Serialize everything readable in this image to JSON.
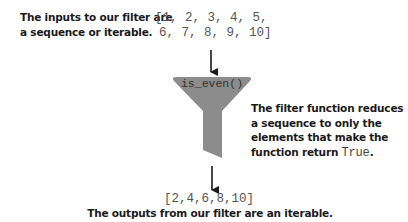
{
  "input": {
    "label_lines": [
      "The inputs to our filter are",
      "a sequence or iterable."
    ],
    "list_lines": [
      "[1, 2, 3, 4, 5,",
      "6, 7, 8, 9, 10]"
    ]
  },
  "filter": {
    "function_label": "is_even()",
    "fill_color": "#8c8c8c",
    "description_lines": [
      "The filter function reduces",
      "a sequence to only the",
      "elements that make the"
    ],
    "description_last_prefix": "function return ",
    "description_last_code": "True",
    "description_last_suffix": "."
  },
  "output": {
    "list": "[2,4,6,8,10]",
    "label": "The outputs from our filter are an iterable."
  }
}
